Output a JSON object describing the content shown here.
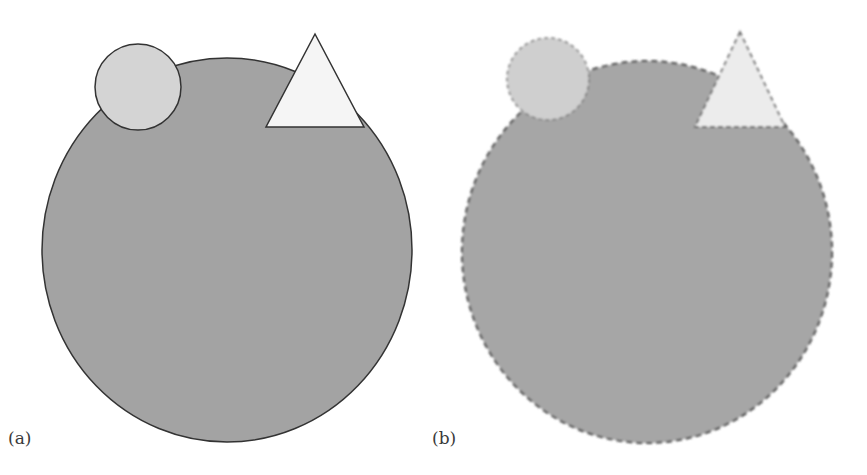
{
  "panels": [
    {
      "label": "(a)",
      "style": "sharp",
      "large_circle": {
        "cx": 227,
        "cy": 250,
        "rx": 185,
        "ry": 192,
        "fill": "#a3a3a3"
      },
      "small_circle": {
        "cx": 138,
        "cy": 87,
        "r": 43,
        "fill": "#d4d4d4"
      },
      "triangle": {
        "points": "315,34 266,127 364,127",
        "fill": "#f5f5f5"
      }
    },
    {
      "label": "(b)",
      "style": "blurred-dashed",
      "large_circle": {
        "cx": 647,
        "cy": 252,
        "rx": 185,
        "ry": 191,
        "fill": "#a6a6a6"
      },
      "small_circle": {
        "cx": 548,
        "cy": 79,
        "r": 41,
        "fill": "#cfcfcf"
      },
      "triangle": {
        "points": "740,32 695,127 785,127",
        "fill": "#ececec"
      }
    }
  ],
  "colors": {
    "stroke": "#333333",
    "background": "#ffffff"
  }
}
